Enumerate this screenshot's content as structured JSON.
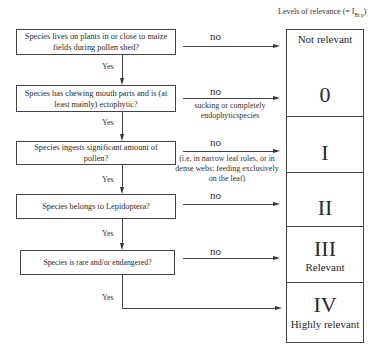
{
  "header": {
    "title": "Levels of relevance (= I",
    "subscript": "Bt p",
    "close": ")"
  },
  "questions": [
    {
      "text": "Species lives on plants in or close to maize fields during pollen shed?"
    },
    {
      "text": "Species has chewing mouth parts and is (at least mainly) ectophytic?"
    },
    {
      "text": "Species ingests significant amount of pollen?"
    },
    {
      "text": "Species belongs to Lepidoptera?"
    },
    {
      "text": "Species is rare and/or endangered?"
    }
  ],
  "branches": {
    "yes_label": "Yes",
    "no_label": "no",
    "notes": {
      "q2": "sucking or completely endophyticspecies",
      "q3": "(i.e, in narrow leaf roles, or in dense webs; feeding exclusively on the leaf)"
    }
  },
  "levels": [
    {
      "roman": "",
      "label": "Not relevant"
    },
    {
      "roman": "0",
      "label": ""
    },
    {
      "roman": "I",
      "label": ""
    },
    {
      "roman": "II",
      "label": ""
    },
    {
      "roman": "III",
      "label": "Relevant"
    },
    {
      "roman": "IV",
      "label": "Highly relevant"
    }
  ]
}
